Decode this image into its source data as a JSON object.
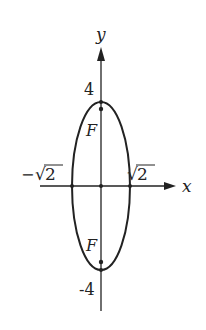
{
  "figure": {
    "type": "ellipse-diagram",
    "axes": {
      "x_label": "x",
      "y_label": "y"
    },
    "ticks": {
      "y_top": "4",
      "y_bottom": "-4",
      "x_left_minus": "−",
      "x_left_radical": "√",
      "x_left_value": "2",
      "x_right_radical": "√",
      "x_right_value": "2"
    },
    "foci": {
      "upper_label": "F",
      "lower_label": "F"
    },
    "ellipse": {
      "semi_major_axis": 4,
      "semi_minor_axis": "√2",
      "orientation": "vertical",
      "center": [
        0,
        0
      ]
    },
    "colors": {
      "stroke": "#222222",
      "background": "#ffffff"
    }
  }
}
